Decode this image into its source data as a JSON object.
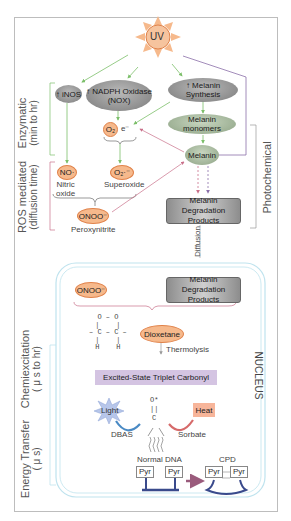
{
  "diagram": {
    "source": {
      "label": "UV"
    },
    "phases": {
      "enzymatic": {
        "title": "Enzymatic",
        "subtitle": "(min to hr)"
      },
      "ros": {
        "title": "ROS mediated",
        "subtitle": "(diffusion time)"
      },
      "photochemical": {
        "title": "Photochemical"
      },
      "chemiexcitation": {
        "title": "Chemiexcitation",
        "subtitle": "( μ s to hr)"
      },
      "energy_transfer": {
        "title": "Energy Transfer",
        "subtitle": "( μ s)"
      }
    },
    "enzymes": {
      "inos": "↑ iNOS",
      "nox_line1": "↑ NADPH Oxidase",
      "nox_line2": "(NOX)",
      "melanin_synthesis": "↑ Melanin Synthesis"
    },
    "species": {
      "o2": "O₂",
      "electron": "e⁻",
      "no": "NO·",
      "no_name_line1": "Nitric",
      "no_name_line2": "oxide",
      "superoxide": "O₂·⁻",
      "superoxide_name": "Superoxide",
      "onoo": "ONOO⁻",
      "onoo_name": "Peroxynitrite"
    },
    "melanin": {
      "monomers": "Melanin monomers",
      "melanin": "Melanin",
      "degradation_line1": "Melanin Degradation",
      "degradation_line2": "Products",
      "diffusion": "Diffusion"
    },
    "nucleus": {
      "label": "NUCLEUS",
      "onoo": "ONOO⁻",
      "degradation_line1": "Melanin Degradation",
      "degradation_line2": "Products",
      "dioxetane_structure": "O – O\n|    |\n– C – C –\n|    |\nH    H",
      "dioxetane": "Dioxetane",
      "thermolysis": "Thermolysis",
      "triplet": "Excited-State Triplet Carbonyl",
      "carbonyl_structure": "O*\n||\nC",
      "light": "Light",
      "dbas": "DBAS",
      "heat": "Heat",
      "sorbate": "Sorbate",
      "normal_dna": "Normal DNA",
      "pyr": "Pyr",
      "cpd": "CPD"
    },
    "colors": {
      "enzymatic_arrow": "#7cbf6a",
      "ros_arrow": "#c9708a",
      "photochemical_arrow": "#8a6fa8",
      "nucleus_border": "#bfe3ee",
      "uv_fill": "#f6b98c",
      "dna_backbone": "#3a4a8c"
    }
  }
}
